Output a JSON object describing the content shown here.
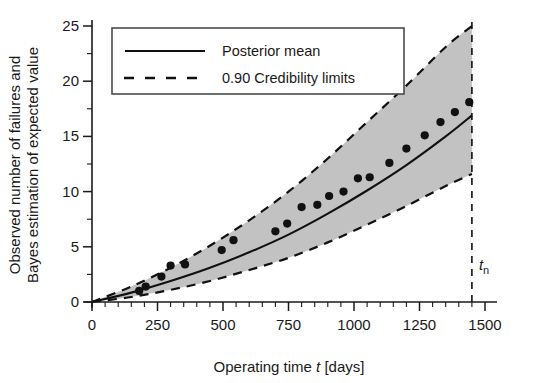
{
  "chart_data": {
    "type": "scatter",
    "title": "",
    "subtitle": "",
    "xlabel_parts": {
      "pre": "Operating time ",
      "symbol": "t",
      "post": " [days]"
    },
    "xlabel": "Operating time t [days]",
    "ylabel_line1": "Observed number of failures and",
    "ylabel_line2": "Bayes estimation of expected value",
    "ylabel": "Observed number of failures and Bayes estimation of expected value",
    "xlim": [
      0,
      1500
    ],
    "ylim": [
      0,
      25
    ],
    "xticks": [
      0,
      250,
      500,
      750,
      1000,
      1250,
      1500
    ],
    "xtick_labels": [
      "0",
      "250",
      "500",
      "750",
      "1000",
      "1250",
      "1500"
    ],
    "xminor_step": 50,
    "yticks": [
      0,
      5,
      10,
      15,
      20,
      25
    ],
    "ytick_labels": [
      "0",
      "5",
      "10",
      "15",
      "20",
      "25"
    ],
    "yminor_step": 2.5,
    "grid": false,
    "legend_position": "upper-left",
    "legend": [
      {
        "label": "Posterior mean",
        "style": "solid"
      },
      {
        "label": "0.90 Credibility limits",
        "style": "dashed"
      }
    ],
    "annotations": [
      {
        "name": "tn-marker",
        "text": "tn",
        "symbol": "t",
        "subscript": "n",
        "x": 1450,
        "type": "vertical-dashed-line"
      }
    ],
    "colors": {
      "band_fill": "#c2c2c2",
      "line": "#111111",
      "points": "#111111",
      "axis": "#1a1a1a",
      "background": "#ffffff"
    },
    "series": [
      {
        "name": "Observed number of failures",
        "type": "scatter",
        "marker": "filled-circle",
        "points": [
          [
            180,
            1.0
          ],
          [
            205,
            1.4
          ],
          [
            265,
            2.3
          ],
          [
            300,
            3.3
          ],
          [
            355,
            3.4
          ],
          [
            495,
            4.7
          ],
          [
            540,
            5.6
          ],
          [
            700,
            6.4
          ],
          [
            745,
            7.1
          ],
          [
            800,
            8.6
          ],
          [
            860,
            8.8
          ],
          [
            905,
            9.6
          ],
          [
            960,
            10.0
          ],
          [
            1015,
            11.2
          ],
          [
            1060,
            11.3
          ],
          [
            1135,
            12.6
          ],
          [
            1200,
            13.9
          ],
          [
            1270,
            15.1
          ],
          [
            1330,
            16.3
          ],
          [
            1385,
            17.2
          ],
          [
            1440,
            18.1
          ]
        ]
      },
      {
        "name": "Posterior mean",
        "type": "line",
        "style": "solid",
        "x": [
          0,
          150,
          300,
          450,
          600,
          750,
          900,
          1050,
          1200,
          1350,
          1450
        ],
        "y": [
          0.0,
          0.85,
          1.9,
          3.1,
          4.5,
          6.1,
          8.0,
          10.1,
          12.4,
          15.0,
          16.9
        ]
      },
      {
        "name": "0.90 Credibility upper limit",
        "type": "line",
        "style": "dashed",
        "x": [
          0,
          150,
          300,
          450,
          600,
          750,
          900,
          1050,
          1200,
          1350,
          1450
        ],
        "y": [
          0.0,
          1.4,
          3.1,
          5.1,
          7.4,
          10.0,
          13.0,
          16.3,
          19.6,
          23.1,
          25.0
        ]
      },
      {
        "name": "0.90 Credibility lower limit",
        "type": "line",
        "style": "dashed",
        "x": [
          0,
          150,
          300,
          450,
          600,
          750,
          900,
          1050,
          1200,
          1350,
          1450
        ],
        "y": [
          0.0,
          0.45,
          1.1,
          1.9,
          2.9,
          4.0,
          5.4,
          7.0,
          8.7,
          10.5,
          11.6
        ]
      }
    ]
  }
}
